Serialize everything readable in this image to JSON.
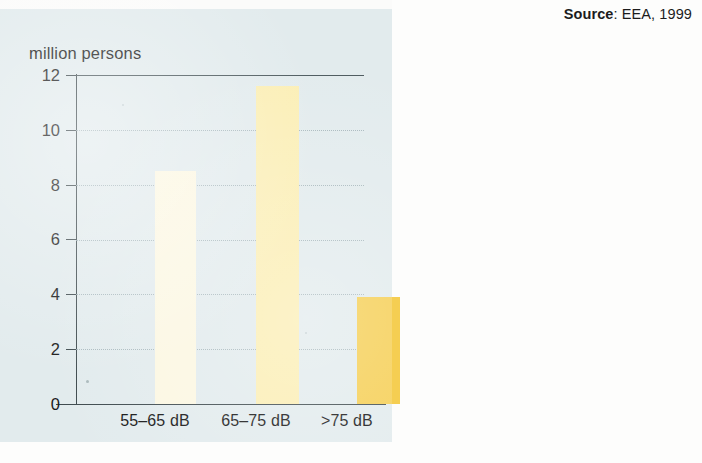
{
  "source": {
    "label": "Source",
    "separator": ": ",
    "text": "EEA, 1999",
    "full": "Source: EEA, 1999"
  },
  "colors": {
    "panel_background": "#e2ebed",
    "page_background": "#fdfdfc",
    "axis": "#3e4a4e",
    "gridline": "#9fb0b5",
    "text": "#1b1b1b",
    "bar_1": "#fcf7e2",
    "bar_2": "#fbeeb4",
    "bar_3": "#f5ce52"
  },
  "chart_data": {
    "type": "bar",
    "title": "",
    "subtitle": "",
    "xlabel": "",
    "ylabel": "million persons",
    "categories": [
      "55–65 dB",
      "65–75 dB",
      ">75 dB"
    ],
    "values": [
      8.5,
      11.6,
      3.9
    ],
    "series": [
      {
        "name": "Population exposed to road traffic noise",
        "values": [
          8.5,
          11.6,
          3.9
        ]
      }
    ],
    "bar_colors": [
      "#fcf7e2",
      "#fbeeb4",
      "#f5ce52"
    ],
    "ylim": [
      0,
      12
    ],
    "xlim": null,
    "y_ticks": [
      0,
      2,
      4,
      6,
      8,
      10,
      12
    ],
    "y_tick_labels": [
      "0",
      "2",
      "4",
      "6",
      "8",
      "10",
      "12"
    ],
    "gridlines": {
      "y": [
        2,
        4,
        6,
        8,
        10
      ],
      "style": "dotted",
      "x": false
    },
    "legend": {
      "visible": false,
      "position": "none",
      "entries": []
    },
    "annotations": [],
    "source_note": "Source: EEA, 1999"
  }
}
